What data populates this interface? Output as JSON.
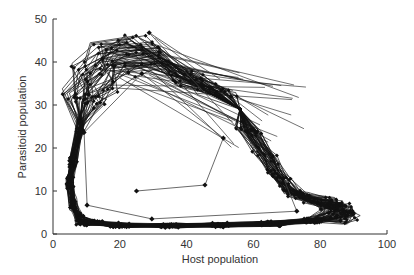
{
  "chart_data": {
    "type": "line",
    "title": "",
    "xlabel": "Host population",
    "ylabel": "Parasitoid population",
    "xlim": [
      0,
      100
    ],
    "ylim": [
      0,
      50
    ],
    "xticks": [
      0,
      20,
      40,
      60,
      80,
      100
    ],
    "yticks": [
      0,
      10,
      20,
      30,
      40,
      50
    ],
    "grid": false,
    "legend": null,
    "series": [
      {
        "name": "transient trajectory",
        "marker": "diamond",
        "x": [
          25,
          45.5,
          51,
          26.6,
          9.3,
          10.2,
          29.6,
          73,
          69,
          28.8
        ],
        "y": [
          10,
          11.4,
          22.3,
          37.3,
          23.6,
          6.7,
          3.5,
          5.3,
          13,
          46.8
        ]
      },
      {
        "name": "attractor band",
        "marker": "diamond",
        "approx_extent": {
          "host_min": 4,
          "host_max": 92,
          "parasitoid_min": 0.5,
          "parasitoid_max": 46
        },
        "key_points": {
          "upper_left_peak": [
            18,
            45
          ],
          "upper_peak_region": [
            30,
            45.5
          ],
          "inner_top_arc": [
            38,
            38
          ],
          "left_edge": [
            5,
            13
          ],
          "lower_left_corner": [
            8,
            2
          ],
          "bottom_edge": [
            50,
            1.5
          ],
          "right_tip": [
            91,
            4
          ],
          "inner_right_notch": [
            76,
            7
          ]
        }
      }
    ]
  },
  "colors": {
    "background": "#ffffff",
    "line": "#111111",
    "axis": "#333333",
    "transient_line": "#444444"
  }
}
